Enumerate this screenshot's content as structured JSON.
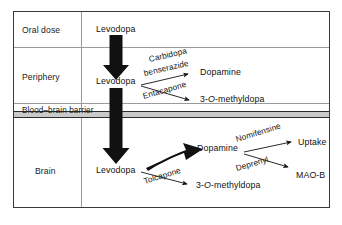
{
  "figure": {
    "rows": [
      {
        "id": "oral-dose",
        "label": "Oral dose"
      },
      {
        "id": "periphery",
        "label": "Periphery"
      },
      {
        "id": "blood-brain-barrier",
        "label": "Blood–brain barrier"
      },
      {
        "id": "brain",
        "label": "Brain"
      }
    ],
    "nodes": {
      "levodopa_oral": "Levodopa",
      "levodopa_periphery": "Levodopa",
      "dopamine_periphery": "Dopamine",
      "methyldopa_periphery_prefix": "3-",
      "methyldopa_periphery_italic": "O",
      "methyldopa_periphery_suffix": "-methyldopa",
      "levodopa_brain": "Levodopa",
      "dopamine_brain": "Dopamine",
      "methyldopa_brain_prefix": "3-",
      "methyldopa_brain_italic": "O",
      "methyldopa_brain_suffix": "-methyldopa",
      "uptake": "Uptake",
      "mao_b": "MAO-B"
    },
    "agents": {
      "carbidopa": "Carbidopa",
      "benserazide": "benserazide",
      "entacapone": "Entacapone",
      "tolcapone": "Tolcapone",
      "nomifensine": "Nomifensine",
      "deprenyl": "Deprenyl"
    },
    "colors": {
      "frame": "#3a3a3a",
      "divider": "#9a9a9a",
      "barrier_fill": "#c9c9c9",
      "barrier_line": "#2b2b2b",
      "arrow": "#111111",
      "text": "#1a1a1a",
      "background": "#ffffff"
    }
  }
}
